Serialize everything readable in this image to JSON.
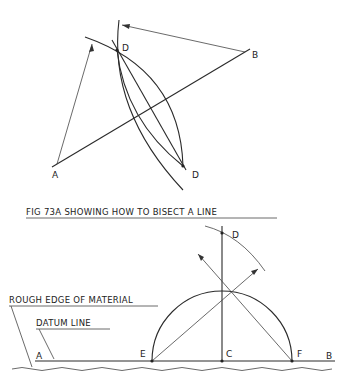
{
  "figure_top": {
    "labels": {
      "a": "A",
      "b": "B",
      "d_top": "D",
      "d_bottom": "D"
    }
  },
  "caption": "FIG 73A SHOWING HOW TO BISECT A LINE",
  "figure_bottom": {
    "labels": {
      "a": "A",
      "b": "B",
      "c": "C",
      "d": "D",
      "e": "E",
      "f": "F"
    },
    "annotations": {
      "rough_edge": "ROUGH EDGE OF MATERIAL",
      "datum_line": "DATUM LINE"
    }
  }
}
